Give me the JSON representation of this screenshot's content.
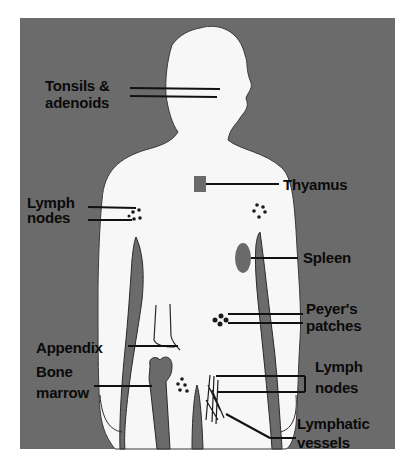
{
  "diagram": {
    "colors": {
      "background": "#ffffff",
      "panel": "#6b6b6b",
      "body": "#f7f7f7",
      "organ": "#6a6a6a",
      "text": "#0a0a0a"
    },
    "labels": [
      {
        "id": "tonsils",
        "lines": [
          "Tonsils &",
          "adenoids"
        ]
      },
      {
        "id": "thymus",
        "lines": [
          "Thyamus"
        ]
      },
      {
        "id": "lymph-nodes-axillary",
        "lines": [
          "Lymph",
          "nodes"
        ]
      },
      {
        "id": "spleen",
        "lines": [
          "Spleen"
        ]
      },
      {
        "id": "peyers-patches",
        "lines": [
          "Peyer's",
          "patches"
        ]
      },
      {
        "id": "appendix",
        "lines": [
          "Appendix"
        ]
      },
      {
        "id": "bone-marrow",
        "lines": [
          "Bone",
          "marrow"
        ]
      },
      {
        "id": "lymph-nodes-inguinal",
        "lines": [
          "Lymph",
          "nodes"
        ]
      },
      {
        "id": "lymphatic-vessels",
        "lines": [
          "Lymphatic",
          "vessels"
        ]
      }
    ]
  }
}
